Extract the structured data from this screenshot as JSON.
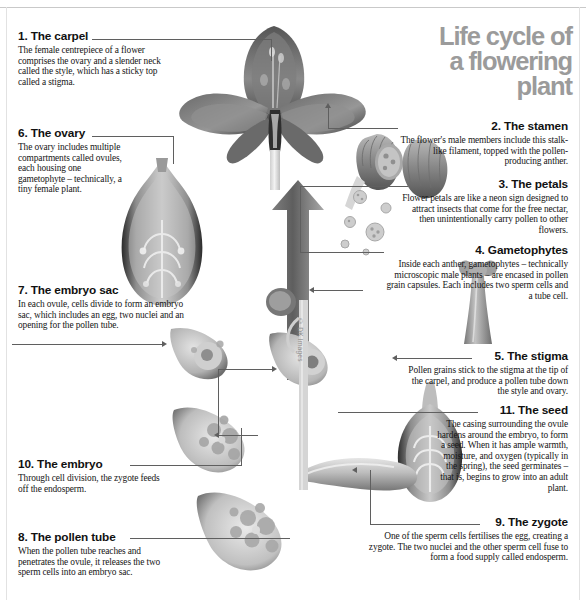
{
  "masthead": {
    "line1": "Life cycle of",
    "line2": "a flowering",
    "line3": "plant"
  },
  "watermark": "© DK Images",
  "sections": [
    {
      "id": "carpel",
      "number": "1.",
      "heading": "1. The carpel",
      "body": "The female centrepiece of a flower comprises the ovary and a slender neck called the style, which has a sticky top called a stigma.",
      "align": "left"
    },
    {
      "id": "ovary",
      "number": "6.",
      "heading": "6. The ovary",
      "body": "The ovary includes multiple compartments called ovules, each housing one gametophyte – technically, a tiny female plant.",
      "align": "left"
    },
    {
      "id": "embryo-sac",
      "number": "7.",
      "heading": "7. The embryo sac",
      "body": "In each ovule, cells divide to form an embryo sac, which includes an egg, two nuclei and an opening for the pollen tube.",
      "align": "left"
    },
    {
      "id": "embryo",
      "number": "10.",
      "heading": "10. The embryo",
      "body": "Through cell division, the zygote feeds off the endosperm.",
      "align": "left"
    },
    {
      "id": "pollen-tube",
      "number": "8.",
      "heading": "8. The pollen tube",
      "body": "When the pollen tube reaches and penetrates the ovule, it releases the two sperm cells into an embryo sac.",
      "align": "left"
    },
    {
      "id": "stamen",
      "number": "2.",
      "heading": "2. The stamen",
      "body": "The flower's male members include this stalk-like filament, topped with the pollen-producing anther.",
      "align": "right"
    },
    {
      "id": "petals",
      "number": "3.",
      "heading": "3. The petals",
      "body": "Flower petals are like a neon sign designed to attract insects that come for the free nectar, then unintentionally carry pollen to other flowers.",
      "align": "right"
    },
    {
      "id": "gametophytes",
      "number": "4.",
      "heading": "4. Gametophytes",
      "body": "Inside each anther, gametophytes – technically microscopic male plants – are encased in pollen grain capsules. Each includes two sperm cells and a tube cell.",
      "align": "right"
    },
    {
      "id": "stigma",
      "number": "5.",
      "heading": "5. The stigma",
      "body": "Pollen grains stick to the stigma at the tip of the carpel, and produce a pollen tube down the style and ovary.",
      "align": "right"
    },
    {
      "id": "seed",
      "number": "11.",
      "heading": "11. The seed",
      "body": "The casing surrounding the ovule hardens around the embryo, to form a seed. When it has ample warmth, moisture, and oxygen (typically in the spring), the seed germinates – that is, begins to grow into an adult plant.",
      "align": "right"
    },
    {
      "id": "zygote",
      "number": "9.",
      "heading": "9. The zygote",
      "body": "One of the sperm cells fertilises the egg, creating a zygote. The two nuclei and the other sperm cell fuse to form a food supply called endosperm.",
      "align": "right"
    }
  ],
  "illustrations": {
    "flower": "flower-xray-illustration",
    "ovary": "ovary-xray-illustration",
    "anther": "anther-pollen-illustration",
    "pollen_grains": "pollen-grain-capsules",
    "stigma_stalk": "stigma-style-illustration",
    "seed": "seed-xray-illustration",
    "embryo_sac_small": "embryo-sac-illustration",
    "zygote": "zygote-illustration",
    "embryo": "embryo-illustration",
    "pollen_tube": "pollen-tube-illustration",
    "cycle_arrow": "cycle-up-arrow"
  },
  "colors": {
    "masthead": "#9b9b9b",
    "leader": "#5f5f5f",
    "text": "#111111",
    "art_dark": "#3b3b3b",
    "art_mid": "#8e8e8e",
    "art_light": "#cfcfcf"
  }
}
